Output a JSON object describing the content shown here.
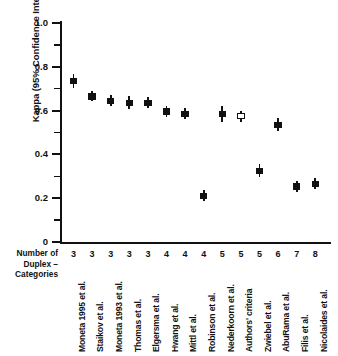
{
  "chart_data": {
    "type": "scatter",
    "title": "",
    "xlabel": "",
    "ylabel": "Kappa (95% Confidence Interval)",
    "ylim": [
      0,
      1.0
    ],
    "y_major_ticks": [
      "0",
      "0.2",
      "0.4",
      "0.6",
      "0.8",
      "1.0"
    ],
    "y_minor_ticks": [
      0.1,
      0.3,
      0.5,
      0.7,
      0.9
    ],
    "grid": false,
    "legend": "none",
    "row_header": "Number of Duplex – Categories",
    "categories": [
      "Moneta 1995 et al.",
      "Staikov et al.",
      "Moneta 1993 et al.",
      "Thomas et al.",
      "Elgersma et al.",
      "Hwang et al.",
      "Mittl et al.",
      "Robinson et al.",
      "Nederkoorn et al.",
      "Authors' criteria",
      "Zwiebel et al.",
      "AbuRama et al.",
      "Filis et al.",
      "Nicolaides et al."
    ],
    "duplex_categories": [
      3,
      3,
      3,
      3,
      3,
      4,
      4,
      4,
      5,
      5,
      5,
      6,
      7,
      8
    ],
    "values": [
      0.735,
      0.665,
      0.645,
      0.635,
      0.635,
      0.595,
      0.585,
      0.21,
      0.585,
      0.575,
      0.325,
      0.535,
      0.253,
      0.265
    ],
    "ci_low": [
      0.705,
      0.645,
      0.62,
      0.605,
      0.61,
      0.57,
      0.56,
      0.185,
      0.55,
      0.55,
      0.295,
      0.505,
      0.228,
      0.24
    ],
    "ci_high": [
      0.768,
      0.69,
      0.672,
      0.665,
      0.662,
      0.62,
      0.612,
      0.238,
      0.62,
      0.6,
      0.355,
      0.565,
      0.28,
      0.292
    ],
    "marker_style": [
      "filled",
      "filled",
      "filled",
      "filled",
      "filled",
      "filled",
      "filled",
      "filled",
      "filled",
      "open",
      "filled",
      "filled",
      "filled",
      "filled"
    ],
    "series_color": "#111111"
  }
}
